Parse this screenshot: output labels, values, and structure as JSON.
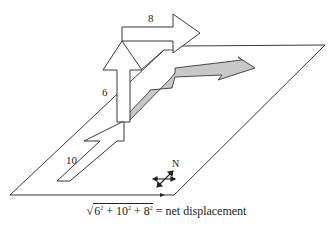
{
  "diagram": {
    "type": "3d-displacement-vectors",
    "vectors": [
      {
        "name": "ground-leg",
        "label": "10",
        "style": "outline"
      },
      {
        "name": "vertical-leg",
        "label": "6",
        "style": "outline"
      },
      {
        "name": "horizontal-leg",
        "label": "8",
        "style": "outline"
      },
      {
        "name": "projection",
        "label": "",
        "style": "gray-filled"
      }
    ],
    "compass": {
      "label": "N"
    },
    "colors": {
      "stroke": "#222222",
      "fill_gray": "#c8c8c8",
      "background": "#ffffff"
    }
  },
  "labels": {
    "eight": "8",
    "six": "6",
    "ten": "10",
    "north": "N"
  },
  "caption": {
    "sqrt_open": "√",
    "term1_base": "6",
    "term1_exp": "2",
    "plus1": " + ",
    "term2_base": "10",
    "term2_exp": "2",
    "plus2": " + ",
    "term3_base": "8",
    "term3_exp": "2",
    "rhs": " = net displacement"
  }
}
